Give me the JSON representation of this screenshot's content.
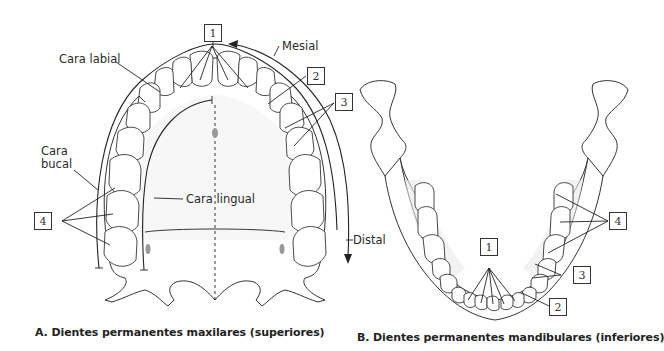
{
  "figure": {
    "panel_a": {
      "caption": "A. Dientes permanentes maxilares (superiores)",
      "labels": {
        "cara_labial": "Cara labial",
        "mesial": "Mesial",
        "cara_bucal_line1": "Cara",
        "cara_bucal_line2": "bucal",
        "cara_lingual": "Cara lingual",
        "distal": "Distal"
      },
      "callouts": [
        "1",
        "2",
        "3",
        "4"
      ]
    },
    "panel_b": {
      "caption": "B. Dientes permanentes mandibulares (inferiores)",
      "callouts": [
        "1",
        "2",
        "3",
        "4"
      ]
    }
  }
}
